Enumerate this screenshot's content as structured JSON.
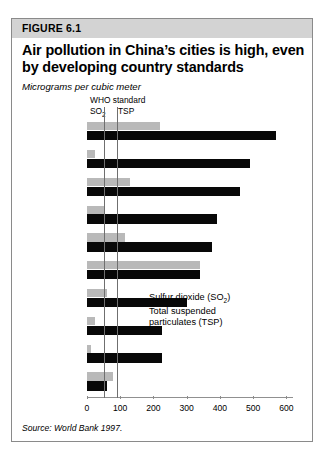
{
  "figure": {
    "banner_label": "FIGURE 6.1",
    "title": "Air pollution in China’s cities is high, even by developing country standards",
    "units": "Micrograms per cubic meter",
    "source": "Source: World Bank 1997."
  },
  "who_standard": {
    "heading": "WHO standard",
    "so2_label": "SO",
    "so2_sub": "2",
    "tsp_label": "TSP",
    "so2_value": 50,
    "tsp_value": 90
  },
  "legend": {
    "so2_line1": "Sulfur dioxide (SO",
    "so2_sub": "2",
    "so2_line1_end": ")",
    "tsp_line1": "Total suspended",
    "tsp_line2": "particulates (TSP)"
  },
  "colors": {
    "so2_bar": "#b9b9b9",
    "tsp_bar": "#080808",
    "banner": "#d3d3d3",
    "border": "#8a8a8a",
    "axis": "#8c8c8c"
  },
  "chart_data": {
    "type": "bar",
    "title": "Air pollution in China’s cities is high, even by developing country standards",
    "subtitle": "Micrograms per cubic meter",
    "xlabel": "",
    "ylabel": "",
    "orientation": "horizontal",
    "xlim": [
      0,
      620
    ],
    "xticks": [
      0,
      100,
      200,
      300,
      400,
      500,
      600
    ],
    "xticklabels": [
      "0",
      "100",
      "200",
      "300",
      "400",
      "500",
      "600"
    ],
    "grid": false,
    "legend_position": "inside-right",
    "categories": [
      "Taiyuan",
      "Delhi",
      "Jinan",
      "Calcutta",
      "Beijing",
      "Chongqing",
      "Guangzhou",
      "Kuala Lumpur",
      "Bangkok",
      "New York City"
    ],
    "series": [
      {
        "name": "Sulfur dioxide (SO2)",
        "color": "#b9b9b9",
        "values": [
          220,
          25,
          130,
          50,
          115,
          340,
          60,
          25,
          11,
          78
        ]
      },
      {
        "name": "Total suspended particulates (TSP)",
        "color": "#080808",
        "values": [
          570,
          490,
          460,
          390,
          375,
          340,
          300,
          225,
          225,
          60
        ]
      }
    ],
    "reference_lines": [
      {
        "label": "WHO standard SO2",
        "value": 50
      },
      {
        "label": "WHO standard TSP",
        "value": 90
      }
    ],
    "source": "Source: World Bank 1997."
  }
}
